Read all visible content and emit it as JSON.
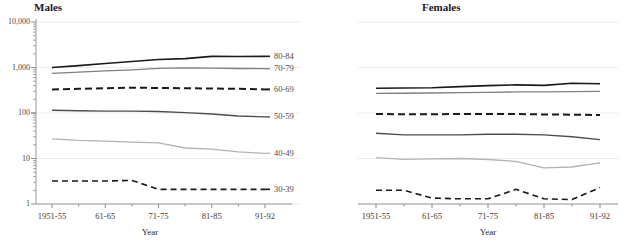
{
  "figure": {
    "panels": [
      {
        "id": "males",
        "title": "Males"
      },
      {
        "id": "females",
        "title": "Females"
      }
    ],
    "axis_title_x": "Year",
    "y_tick_labels": [
      "10,000",
      "1,000",
      "100",
      "10",
      "1"
    ],
    "x_tick_labels": [
      "1951-55",
      "61-65",
      "71-75",
      "81-85",
      "91-92"
    ],
    "series_labels": [
      "80-84",
      "70-79",
      "60-69",
      "50-59",
      "40-49",
      "30-39"
    ]
  },
  "chart_data": {
    "type": "line",
    "title": "",
    "xlabel": "Year",
    "ylabel": "",
    "yscale": "log",
    "ylim": [
      1,
      10000
    ],
    "yticks": [
      1,
      10,
      100,
      1000,
      10000
    ],
    "ytick_labels": [
      "1",
      "10",
      "100",
      "1,000",
      "10,000"
    ],
    "grid": true,
    "legend": "inline-right-labels",
    "categories": [
      "1951-55",
      "56-60",
      "61-65",
      "66-70",
      "71-75",
      "76-80",
      "81-85",
      "86-90",
      "91-92"
    ],
    "panels": [
      {
        "name": "Males",
        "series": [
          {
            "name": "80-84",
            "style": "solid",
            "color": "#1a1a1a",
            "width": 1.6,
            "values": [
              1000,
              1100,
              1220,
              1350,
              1500,
              1570,
              1760,
              1740,
              1760
            ]
          },
          {
            "name": "70-79",
            "style": "solid",
            "color": "#808080",
            "width": 1.3,
            "values": [
              740,
              790,
              840,
              890,
              960,
              980,
              970,
              950,
              940
            ]
          },
          {
            "name": "60-69",
            "style": "dashed",
            "color": "#1a1a1a",
            "width": 2.0,
            "values": [
              330,
              340,
              350,
              360,
              355,
              350,
              345,
              340,
              330
            ]
          },
          {
            "name": "50-59",
            "style": "solid",
            "color": "#4d4d4d",
            "width": 1.4,
            "values": [
              115,
              112,
              110,
              110,
              108,
              102,
              95,
              86,
              82
            ]
          },
          {
            "name": "40-49",
            "style": "solid",
            "color": "#b3b3b3",
            "width": 1.3,
            "values": [
              27,
              25,
              24,
              23,
              22,
              17,
              16,
              14,
              13
            ]
          },
          {
            "name": "30-39",
            "style": "dashed",
            "color": "#1a1a1a",
            "width": 1.6,
            "values": [
              3.2,
              3.2,
              3.2,
              3.3,
              2.1,
              2.1,
              2.1,
              2.1,
              2.1
            ]
          }
        ]
      },
      {
        "name": "Females",
        "series": [
          {
            "name": "80-84",
            "style": "solid",
            "color": "#1a1a1a",
            "width": 1.6,
            "values": [
              350,
              355,
              360,
              380,
              400,
              415,
              405,
              450,
              440
            ]
          },
          {
            "name": "70-79",
            "style": "solid",
            "color": "#808080",
            "width": 1.3,
            "values": [
              270,
              272,
              275,
              280,
              285,
              290,
              290,
              295,
              300
            ]
          },
          {
            "name": "60-69",
            "style": "dashed",
            "color": "#1a1a1a",
            "width": 2.0,
            "values": [
              95,
              94,
              94,
              95,
              95,
              95,
              93,
              92,
              90
            ]
          },
          {
            "name": "50-59",
            "style": "solid",
            "color": "#4d4d4d",
            "width": 1.4,
            "values": [
              36,
              33,
              33,
              33,
              34,
              34,
              33,
              30,
              26
            ]
          },
          {
            "name": "40-49",
            "style": "solid",
            "color": "#b3b3b3",
            "width": 1.3,
            "values": [
              10.5,
              9.6,
              9.8,
              10.0,
              9.5,
              8.6,
              6.2,
              6.5,
              8.0
            ]
          },
          {
            "name": "30-39",
            "style": "dashed",
            "color": "#1a1a1a",
            "width": 1.6,
            "values": [
              2.0,
              2.0,
              1.35,
              1.3,
              1.3,
              2.1,
              1.3,
              1.25,
              2.3
            ]
          }
        ]
      }
    ]
  }
}
